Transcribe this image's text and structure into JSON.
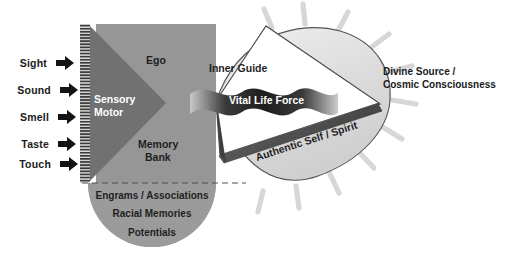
{
  "diagram": {
    "senses": [
      {
        "label": "Sight",
        "icon": "arrow-right-icon"
      },
      {
        "label": "Sound",
        "icon": "arrow-right-icon"
      },
      {
        "label": "Smell",
        "icon": "arrow-right-icon"
      },
      {
        "label": "Taste",
        "icon": "arrow-right-icon"
      },
      {
        "label": "Touch",
        "icon": "arrow-right-icon"
      }
    ],
    "regions": {
      "sensory_motor_line1": "Sensory",
      "sensory_motor_line2": "Motor",
      "ego": "Ego",
      "memory_bank_line1": "Memory",
      "memory_bank_line2": "Bank",
      "inner_guide": "Inner Guide",
      "vital_life_force": "Vital Life Force",
      "authentic_self": "Authentic Self / Spirit"
    },
    "subconscious": {
      "items": [
        "Engrams / Associations",
        "Racial Memories",
        "Potentials"
      ]
    },
    "source": {
      "line1": "Divine Source /",
      "line2": "Cosmic Consciousness"
    },
    "colors": {
      "dark_gray": "#717171",
      "mid_gray": "#969696",
      "light_gray": "#9b9b9b",
      "pale_gray": "#d8d8d8",
      "ray_gray": "#d5d5d5",
      "edge_dark": "#4a4a4a",
      "arrow_black": "#141414",
      "outline": "#3c3c3c",
      "text_dark": "#1a1a1a",
      "white": "#ffffff"
    }
  }
}
